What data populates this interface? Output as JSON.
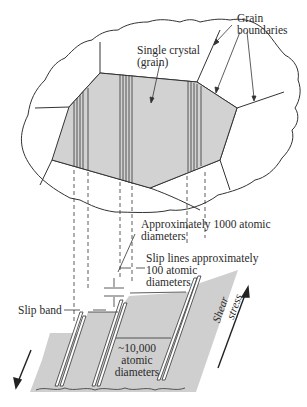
{
  "diagram": {
    "type": "materials-science-illustration",
    "colors": {
      "grain_fill": "#d2d2d2",
      "block_fill": "#cfcfcf",
      "line": "#333333",
      "background": "#ffffff"
    }
  },
  "labels": {
    "grain_boundaries": [
      "Grain",
      "boundaries"
    ],
    "single_crystal": [
      "Single crystal",
      "(grain)"
    ],
    "approx_1000": [
      "Approximately 1000 atomic",
      "diameters"
    ],
    "slip_lines": [
      "Slip lines approximately",
      "100 atomic",
      "diameters"
    ],
    "slip_band": "Slip band",
    "approx_10000": [
      "~10,000",
      "atomic",
      "diameters"
    ],
    "shear_stress": [
      "Shear",
      "stress"
    ]
  }
}
